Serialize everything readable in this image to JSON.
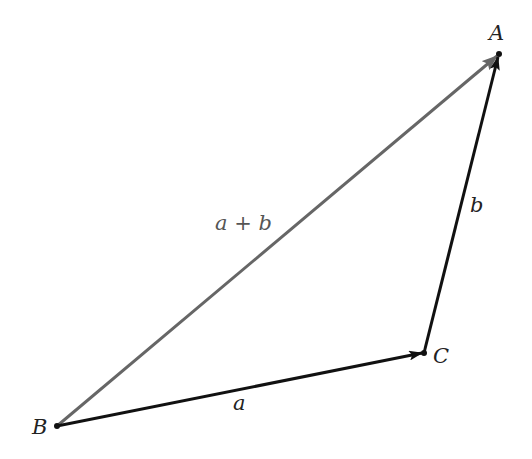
{
  "diagram": {
    "type": "vector-addition-triangle",
    "points": {
      "A": {
        "label": "A",
        "x": 499,
        "y": 54
      },
      "B": {
        "label": "B",
        "x": 57,
        "y": 426
      },
      "C": {
        "label": "C",
        "x": 424,
        "y": 353
      }
    },
    "vectors": [
      {
        "name": "a",
        "label": "a",
        "from": "B",
        "to": "C",
        "color": "#111111"
      },
      {
        "name": "b",
        "label": "b",
        "from": "C",
        "to": "A",
        "color": "#111111"
      },
      {
        "name": "a_plus_b",
        "label": "a + b",
        "from": "B",
        "to": "A",
        "color": "#666666"
      }
    ]
  }
}
